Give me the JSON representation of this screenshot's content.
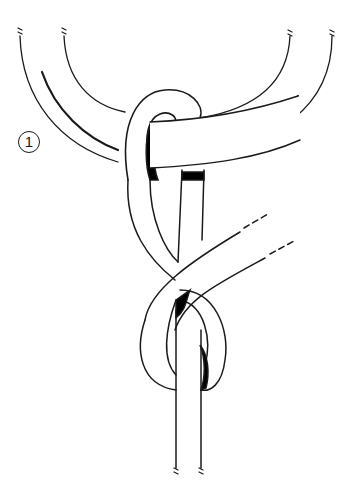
{
  "diagram": {
    "step_number": "1",
    "colors": {
      "stroke": "#1a1a1a",
      "fill": "#ffffff",
      "shadow": "#000000"
    },
    "elements": [
      "ring",
      "rope loop around ring",
      "standing part",
      "working end (dashed continuation)",
      "figure-eight knot"
    ]
  }
}
